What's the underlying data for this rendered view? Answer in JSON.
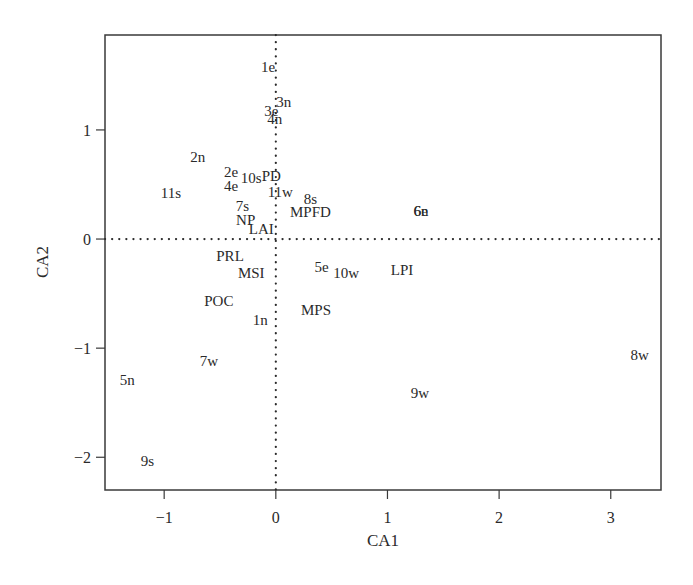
{
  "chart_data": {
    "type": "scatter",
    "title": "",
    "xlabel": "CA1",
    "ylabel": "CA2",
    "xlim": [
      -1.53,
      3.45
    ],
    "ylim": [
      -2.3,
      1.87
    ],
    "xticks": [
      -1,
      0,
      1,
      2,
      3
    ],
    "yticks": [
      -2,
      -1,
      0,
      1
    ],
    "grid": false,
    "reference_lines": {
      "x": 0,
      "y": 0,
      "style": "dotted"
    },
    "legend": null,
    "points": [
      {
        "label": "1e",
        "x": -0.07,
        "y": 1.58
      },
      {
        "label": "3n",
        "x": 0.07,
        "y": 1.26
      },
      {
        "label": "3e",
        "x": -0.04,
        "y": 1.17
      },
      {
        "label": "4n",
        "x": -0.01,
        "y": 1.1
      },
      {
        "label": "2n",
        "x": -0.7,
        "y": 0.75
      },
      {
        "label": "2e",
        "x": -0.4,
        "y": 0.61
      },
      {
        "label": "10s",
        "x": -0.22,
        "y": 0.56
      },
      {
        "label": "PD",
        "x": -0.04,
        "y": 0.58
      },
      {
        "label": "4e",
        "x": -0.4,
        "y": 0.49
      },
      {
        "label": "11s",
        "x": -0.94,
        "y": 0.42
      },
      {
        "label": "11w",
        "x": 0.04,
        "y": 0.43
      },
      {
        "label": "8s",
        "x": 0.31,
        "y": 0.37
      },
      {
        "label": "7s",
        "x": -0.3,
        "y": 0.3
      },
      {
        "label": "MPFD",
        "x": 0.31,
        "y": 0.25
      },
      {
        "label": "6e",
        "x": 1.3,
        "y": 0.26
      },
      {
        "label": "6n",
        "x": 1.3,
        "y": 0.26
      },
      {
        "label": "NP",
        "x": -0.27,
        "y": 0.17
      },
      {
        "label": "LAI",
        "x": -0.13,
        "y": 0.09
      },
      {
        "label": "PRL",
        "x": -0.41,
        "y": -0.16
      },
      {
        "label": "MSI",
        "x": -0.22,
        "y": -0.31
      },
      {
        "label": "5e",
        "x": 0.41,
        "y": -0.26
      },
      {
        "label": "10w",
        "x": 0.63,
        "y": -0.31
      },
      {
        "label": "LPI",
        "x": 1.13,
        "y": -0.28
      },
      {
        "label": "POC",
        "x": -0.51,
        "y": -0.57
      },
      {
        "label": "MPS",
        "x": 0.36,
        "y": -0.65
      },
      {
        "label": "1n",
        "x": -0.14,
        "y": -0.74
      },
      {
        "label": "7w",
        "x": -0.6,
        "y": -1.12
      },
      {
        "label": "8w",
        "x": 3.26,
        "y": -1.06
      },
      {
        "label": "5n",
        "x": -1.33,
        "y": -1.29
      },
      {
        "label": "9w",
        "x": 1.29,
        "y": -1.41
      },
      {
        "label": "9s",
        "x": -1.15,
        "y": -2.03
      }
    ]
  },
  "colors": {
    "ink": "#2a2a2a",
    "background": "#ffffff"
  }
}
